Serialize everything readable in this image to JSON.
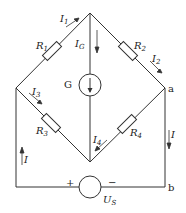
{
  "diagram": {
    "type": "wheatstone-bridge-circuit",
    "resistors": [
      {
        "id": "R1",
        "label": "R",
        "sub": "1"
      },
      {
        "id": "R2",
        "label": "R",
        "sub": "2"
      },
      {
        "id": "R3",
        "label": "R",
        "sub": "3"
      },
      {
        "id": "R4",
        "label": "R",
        "sub": "4"
      }
    ],
    "currents": [
      {
        "id": "I1",
        "label": "I",
        "sub": "1"
      },
      {
        "id": "IG",
        "label": "I",
        "sub": "G"
      },
      {
        "id": "I2",
        "label": "I",
        "sub": "2"
      },
      {
        "id": "I3",
        "label": "I",
        "sub": "3"
      },
      {
        "id": "I4",
        "label": "I",
        "sub": "4"
      },
      {
        "id": "I_left",
        "label": "I"
      },
      {
        "id": "I_right",
        "label": "I"
      }
    ],
    "galvanometer": {
      "label": "G"
    },
    "source": {
      "label": "U",
      "sub": "S",
      "plus": "+",
      "minus": "−"
    },
    "nodes": {
      "a": "a",
      "b": "b"
    }
  }
}
